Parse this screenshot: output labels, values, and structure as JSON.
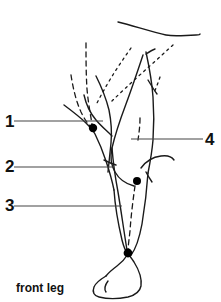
{
  "figure": {
    "caption": "front leg",
    "title_alt": "front leg",
    "background_color": "#ffffff",
    "ink_color": "#1a1a1a",
    "leader_color": "#444444",
    "point_color": "#000000",
    "width": 221,
    "height": 302
  },
  "labels": [
    {
      "id": "1",
      "text": "1",
      "side": "left",
      "leader_y": 121,
      "leader_x1": 14,
      "leader_x2": 103
    },
    {
      "id": "2",
      "text": "2",
      "side": "left",
      "leader_y": 167,
      "leader_x1": 14,
      "leader_x2": 113
    },
    {
      "id": "3",
      "text": "3",
      "side": "left",
      "leader_y": 206,
      "leader_x1": 14,
      "leader_x2": 122
    },
    {
      "id": "4",
      "text": "4",
      "side": "right",
      "leader_y": 139,
      "leader_x1": 131,
      "leader_x2": 203
    }
  ],
  "points": [
    {
      "name": "point-upper",
      "cx": 93,
      "cy": 128,
      "r": 4.2
    },
    {
      "name": "point-middle",
      "cx": 137,
      "cy": 181,
      "r": 4.0
    },
    {
      "name": "point-lower",
      "cx": 128,
      "cy": 253,
      "r": 4.4
    }
  ],
  "drawing": {
    "style": "anatomical line drawing",
    "solid_stroke_width": 1.4,
    "dashed_stroke_width": 1.3,
    "dash_pattern": "5,4",
    "dotted_pattern": "2,4"
  }
}
